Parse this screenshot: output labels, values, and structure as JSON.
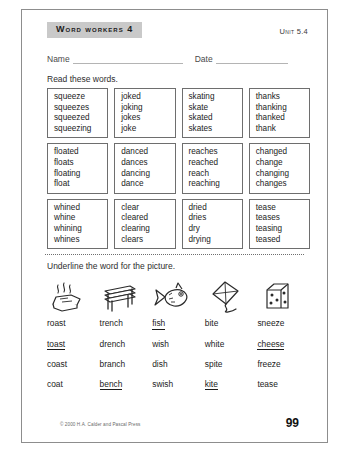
{
  "header": {
    "title": "Word Workers 4",
    "unit": "Unit 5.4"
  },
  "form": {
    "name_label": "Name",
    "date_label": "Date"
  },
  "section1": {
    "instruction": "Read these words.",
    "rows": [
      [
        [
          "squeeze",
          "squeezes",
          "squeezed",
          "squeezing"
        ],
        [
          "joked",
          "joking",
          "jokes",
          "joke"
        ],
        [
          "skating",
          "skate",
          "skated",
          "skates"
        ],
        [
          "thanks",
          "thanking",
          "thanked",
          "thank"
        ]
      ],
      [
        [
          "floated",
          "floats",
          "floating",
          "float"
        ],
        [
          "danced",
          "dances",
          "dancing",
          "dance"
        ],
        [
          "reaches",
          "reached",
          "reach",
          "reaching"
        ],
        [
          "changed",
          "change",
          "changing",
          "changes"
        ]
      ],
      [
        [
          "whined",
          "whine",
          "whining",
          "whines"
        ],
        [
          "clear",
          "cleared",
          "clearing",
          "clears"
        ],
        [
          "dried",
          "dries",
          "dry",
          "drying"
        ],
        [
          "tease",
          "teases",
          "teasing",
          "teased"
        ]
      ]
    ]
  },
  "section2": {
    "instruction": "Underline the word for the picture.",
    "pictures": [
      "roast-icon",
      "bench-icon",
      "fish-icon",
      "kite-icon",
      "cheese-icon"
    ],
    "rows": [
      [
        {
          "word": "roast",
          "underlined": false
        },
        {
          "word": "trench",
          "underlined": false
        },
        {
          "word": "fish",
          "underlined": true
        },
        {
          "word": "bite",
          "underlined": false
        },
        {
          "word": "sneeze",
          "underlined": false
        }
      ],
      [
        {
          "word": "toast",
          "underlined": true
        },
        {
          "word": "drench",
          "underlined": false
        },
        {
          "word": "wish",
          "underlined": false
        },
        {
          "word": "white",
          "underlined": false
        },
        {
          "word": "cheese",
          "underlined": true
        }
      ],
      [
        {
          "word": "coast",
          "underlined": false
        },
        {
          "word": "branch",
          "underlined": false
        },
        {
          "word": "dish",
          "underlined": false
        },
        {
          "word": "spite",
          "underlined": false
        },
        {
          "word": "freeze",
          "underlined": false
        }
      ],
      [
        {
          "word": "coat",
          "underlined": false
        },
        {
          "word": "bench",
          "underlined": true
        },
        {
          "word": "swish",
          "underlined": false
        },
        {
          "word": "kite",
          "underlined": true
        },
        {
          "word": "tease",
          "underlined": false
        }
      ]
    ]
  },
  "footer": {
    "copyright": "© 2000 H.A. Calder and Pascal Press",
    "page_number": "99"
  }
}
